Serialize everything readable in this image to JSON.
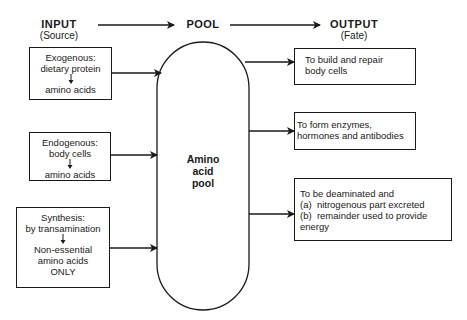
{
  "headers": {
    "input": {
      "title": "INPUT",
      "subtitle": "(Source)"
    },
    "pool": {
      "title": "POOL"
    },
    "output": {
      "title": "OUTPUT",
      "subtitle": "(Fate)"
    }
  },
  "inputs": [
    {
      "title": "Exogenous:",
      "source": "dietary protein",
      "result": "amino acids"
    },
    {
      "title": "Endogenous:",
      "source": "body cells",
      "result": "amino acids"
    },
    {
      "title": "Synthesis:",
      "source": "by transamination",
      "result_lines": [
        "Non-essential",
        "amino acids",
        "ONLY"
      ]
    }
  ],
  "pool": {
    "label_lines": [
      "Amino",
      "acid",
      "pool"
    ]
  },
  "outputs": [
    {
      "lines": [
        "To build and repair",
        "body cells"
      ]
    },
    {
      "lines": [
        "To form enzymes,",
        "hormones and antibodies"
      ]
    },
    {
      "lines": [
        "To be deaminated and",
        "(a)  nitrogenous part excreted",
        "(b)  remainder used to provide",
        "energy"
      ]
    }
  ]
}
